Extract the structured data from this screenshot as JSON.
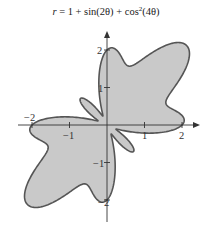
{
  "chart_data": {
    "type": "line",
    "subtype": "polar-filled",
    "title_parts": {
      "r": "r",
      "rest_1": " = 1 + sin(2θ) + cos",
      "sup": "2",
      "rest_2": "(4θ)"
    },
    "function": "r = 1 + sin(2*theta) + cos(4*theta)^2",
    "theta_range": [
      0,
      6.283185
    ],
    "xlabel": "",
    "ylabel": "",
    "xlim": [
      -2.0,
      2.4
    ],
    "ylim": [
      -2.6,
      2.5
    ],
    "x_ticks": [
      -2,
      -1,
      1,
      2
    ],
    "y_ticks": [
      -2,
      -1,
      1,
      2
    ],
    "x_tick_labels": [
      "−2",
      "−1",
      "1",
      "2"
    ],
    "y_tick_labels": [
      "−2",
      "−1",
      "1",
      "2"
    ],
    "grid": false,
    "legend": null,
    "fill_color": "#c9c9c9",
    "stroke_color": "#555555",
    "axis_color": "#333333",
    "sample_points": [
      {
        "theta_deg": 0,
        "r": 2.0
      },
      {
        "theta_deg": 22.5,
        "r": 1.707
      },
      {
        "theta_deg": 45,
        "r": 3.0
      },
      {
        "theta_deg": 67.5,
        "r": 1.707
      },
      {
        "theta_deg": 90,
        "r": 2.0
      },
      {
        "theta_deg": 112.5,
        "r": 0.293
      },
      {
        "theta_deg": 135,
        "r": 1.0
      },
      {
        "theta_deg": 157.5,
        "r": 0.293
      },
      {
        "theta_deg": 180,
        "r": 2.0
      },
      {
        "theta_deg": 202.5,
        "r": 1.707
      },
      {
        "theta_deg": 225,
        "r": 3.0
      },
      {
        "theta_deg": 247.5,
        "r": 1.707
      },
      {
        "theta_deg": 270,
        "r": 2.0
      },
      {
        "theta_deg": 292.5,
        "r": 0.293
      },
      {
        "theta_deg": 315,
        "r": 1.0
      },
      {
        "theta_deg": 337.5,
        "r": 0.293
      }
    ]
  },
  "layout": {
    "origin_px": [
      107,
      125
    ],
    "px_per_unit": 37.5
  }
}
